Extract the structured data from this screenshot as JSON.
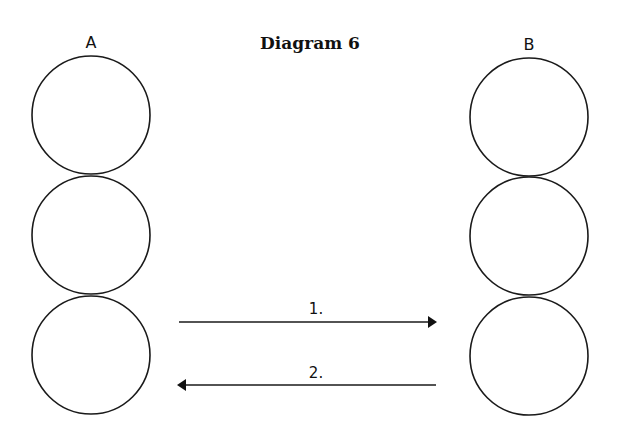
{
  "diagram": {
    "title": "Diagram 6",
    "columns": [
      {
        "label": "A",
        "circles": 3
      },
      {
        "label": "B",
        "circles": 3
      }
    ],
    "arrows": [
      {
        "label": "1.",
        "direction": "right",
        "from": "A",
        "to": "B"
      },
      {
        "label": "2.",
        "direction": "left",
        "from": "B",
        "to": "A"
      }
    ]
  }
}
